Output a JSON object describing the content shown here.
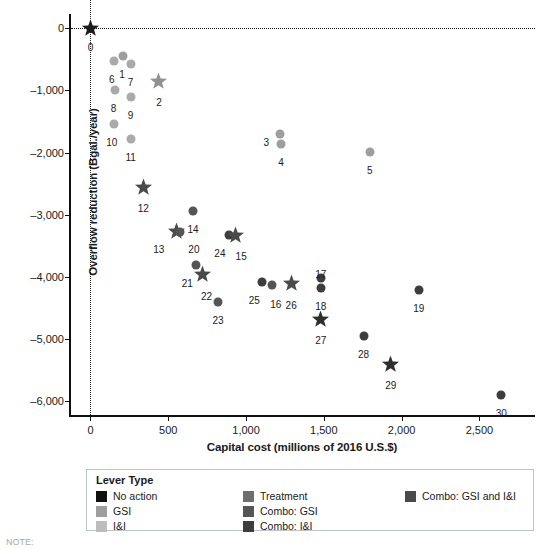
{
  "chart_data": {
    "type": "scatter",
    "title": "",
    "xlabel": "Capital cost (millions of 2016 U.S.$)",
    "ylabel": "Overflow reduction (Bgal./year)",
    "xlim": [
      -125,
      2870
    ],
    "ylim": [
      -6250,
      230
    ],
    "xticks": [
      0,
      500,
      1000,
      1500,
      2000,
      2500
    ],
    "xticklabels": [
      "0",
      "500",
      "1,000",
      "1,500",
      "2,000",
      "2,500"
    ],
    "yticks": [
      0,
      -1000,
      -2000,
      -3000,
      -4000,
      -5000,
      -6000
    ],
    "yticklabels": [
      "0",
      "-1,000",
      "-2,000",
      "-3,000",
      "-4,000",
      "-5,000",
      "-6,000"
    ],
    "grid": false,
    "reference_lines": [
      {
        "axis": "y",
        "value": 0,
        "style": "dotted"
      },
      {
        "axis": "x",
        "value": 0,
        "style": "dotted"
      }
    ],
    "legend_position": "below-plot",
    "points": [
      {
        "label": "0",
        "x": 0,
        "y": 0,
        "marker": "star",
        "category": "No action",
        "color": "#1b1b1b",
        "lx": 0,
        "ly": 14
      },
      {
        "label": "6",
        "x": 150,
        "y": -525,
        "marker": "circle",
        "category": "I&I",
        "color": "#aaaaaa",
        "lx": -2,
        "ly": 13
      },
      {
        "label": "1",
        "x": 210,
        "y": -445,
        "marker": "circle",
        "category": "GSI",
        "color": "#9e9e9e",
        "lx": -1,
        "ly": 13
      },
      {
        "label": "7",
        "x": 258,
        "y": -575,
        "marker": "circle",
        "category": "I&I",
        "color": "#aaaaaa",
        "lx": 0,
        "ly": 13
      },
      {
        "label": "8",
        "x": 155,
        "y": -1000,
        "marker": "circle",
        "category": "I&I",
        "color": "#aaaaaa",
        "lx": -1,
        "ly": 13
      },
      {
        "label": "9",
        "x": 258,
        "y": -1105,
        "marker": "circle",
        "category": "I&I",
        "color": "#aaaaaa",
        "lx": 0,
        "ly": 13
      },
      {
        "label": "2",
        "x": 440,
        "y": -860,
        "marker": "star",
        "category": "Combo: GSI and I&I",
        "color": "#919191",
        "lx": 0,
        "ly": 15
      },
      {
        "label": "10",
        "x": 150,
        "y": -1540,
        "marker": "circle",
        "category": "I&I",
        "color": "#aaaaaa",
        "lx": -2,
        "ly": 13
      },
      {
        "label": "11",
        "x": 258,
        "y": -1775,
        "marker": "circle",
        "category": "I&I",
        "color": "#aaaaaa",
        "lx": 0,
        "ly": 13
      },
      {
        "label": "3",
        "x": 1220,
        "y": -1700,
        "marker": "circle",
        "category": "I&I",
        "color": "#9e9e9e",
        "lx": -14,
        "ly": 3
      },
      {
        "label": "4",
        "x": 1225,
        "y": -1860,
        "marker": "circle",
        "category": "I&I",
        "color": "#9e9e9e",
        "lx": 0,
        "ly": 13
      },
      {
        "label": "5",
        "x": 1795,
        "y": -1985,
        "marker": "circle",
        "category": "I&I",
        "color": "#9e9e9e",
        "lx": 0,
        "ly": 13
      },
      {
        "label": "12",
        "x": 340,
        "y": -2560,
        "marker": "star",
        "category": "Combo: GSI and I&I",
        "color": "#4a4a4a",
        "lx": 0,
        "ly": 15
      },
      {
        "label": "14",
        "x": 660,
        "y": -2940,
        "marker": "circle",
        "category": "Treatment",
        "color": "#555555",
        "lx": 0,
        "ly": 13
      },
      {
        "label": "13",
        "x": 555,
        "y": -3275,
        "marker": "star",
        "category": "Combo: GSI and I&I",
        "color": "#4a4a4a",
        "lx": -18,
        "ly": 12
      },
      {
        "label": "20",
        "x": 575,
        "y": -3275,
        "marker": "circle",
        "category": "Combo: GSI",
        "color": "#555555",
        "lx": 14,
        "ly": 12
      },
      {
        "label": "24",
        "x": 890,
        "y": -3320,
        "marker": "circle",
        "category": "Combo: I&I",
        "color": "#3d3d3d",
        "lx": -9,
        "ly": 13
      },
      {
        "label": "15",
        "x": 930,
        "y": -3330,
        "marker": "star",
        "category": "Combo: GSI and I&I",
        "color": "#4a4a4a",
        "lx": 6,
        "ly": 16
      },
      {
        "label": "21",
        "x": 680,
        "y": -3810,
        "marker": "circle",
        "category": "Combo: GSI",
        "color": "#555555",
        "lx": -9,
        "ly": 13
      },
      {
        "label": "22",
        "x": 720,
        "y": -3960,
        "marker": "star",
        "category": "Combo: GSI and I&I",
        "color": "#4a4a4a",
        "lx": 4,
        "ly": 16
      },
      {
        "label": "25",
        "x": 1105,
        "y": -4080,
        "marker": "circle",
        "category": "Combo: I&I",
        "color": "#3d3d3d",
        "lx": -8,
        "ly": 13
      },
      {
        "label": "16",
        "x": 1165,
        "y": -4135,
        "marker": "circle",
        "category": "Combo: GSI",
        "color": "#555555",
        "lx": 4,
        "ly": 14
      },
      {
        "label": "26",
        "x": 1290,
        "y": -4110,
        "marker": "star",
        "category": "Combo: GSI and I&I",
        "color": "#4a4a4a",
        "lx": 0,
        "ly": 16
      },
      {
        "label": "17",
        "x": 1480,
        "y": -4010,
        "marker": "circle",
        "category": "Combo: I&I",
        "color": "#3d3d3d",
        "lx": 0,
        "ly": -9
      },
      {
        "label": "18",
        "x": 1480,
        "y": -4180,
        "marker": "circle",
        "category": "Combo: I&I",
        "color": "#3d3d3d",
        "lx": 0,
        "ly": 13
      },
      {
        "label": "23",
        "x": 820,
        "y": -4400,
        "marker": "circle",
        "category": "Combo: GSI",
        "color": "#555555",
        "lx": 0,
        "ly": 13
      },
      {
        "label": "19",
        "x": 2110,
        "y": -4210,
        "marker": "circle",
        "category": "Combo: I&I",
        "color": "#3d3d3d",
        "lx": 0,
        "ly": 13
      },
      {
        "label": "27",
        "x": 1480,
        "y": -4680,
        "marker": "star",
        "category": "Combo: GSI and I&I",
        "color": "#2e2e2e",
        "lx": 0,
        "ly": 16
      },
      {
        "label": "28",
        "x": 1755,
        "y": -4950,
        "marker": "circle",
        "category": "Combo: I&I",
        "color": "#3d3d3d",
        "lx": 0,
        "ly": 13
      },
      {
        "label": "29",
        "x": 1930,
        "y": -5405,
        "marker": "star",
        "category": "Combo: GSI and I&I",
        "color": "#2e2e2e",
        "lx": 0,
        "ly": 16
      },
      {
        "label": "30",
        "x": 2640,
        "y": -5890,
        "marker": "circle",
        "category": "Combo: I&I",
        "color": "#3d3d3d",
        "lx": 0,
        "ly": 13
      }
    ]
  },
  "legend": {
    "title": "Lever Type",
    "columns": [
      [
        {
          "label": "No action",
          "color": "#111111"
        },
        {
          "label": "GSI",
          "color": "#9e9e9e"
        },
        {
          "label": "I&I",
          "color": "#bdbdbd"
        }
      ],
      [
        {
          "label": "Treatment",
          "color": "#6e6e6e"
        },
        {
          "label": "Combo: GSI",
          "color": "#555555"
        },
        {
          "label": "Combo: I&I",
          "color": "#3d3d3d"
        }
      ],
      [
        {
          "label": "Combo: GSI and I&I",
          "color": "#4a4a4a"
        }
      ]
    ]
  },
  "caption": {
    "text": "NOTE:"
  }
}
